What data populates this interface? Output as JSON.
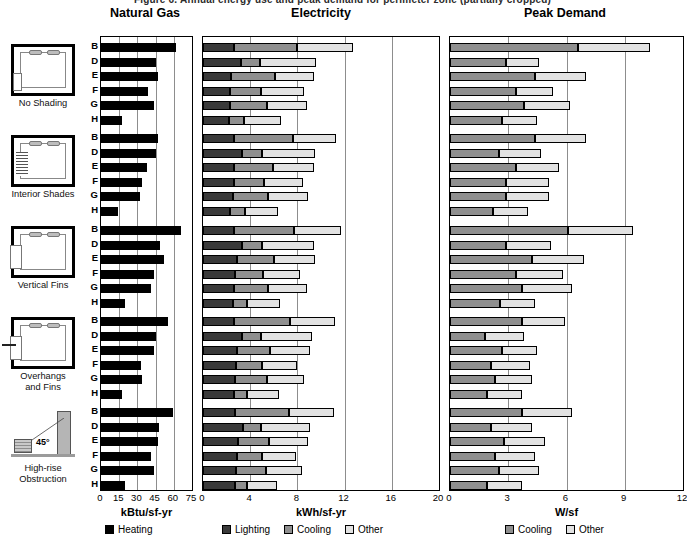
{
  "clipped_header": "Figure 6. Annual energy use and peak demand for perimeter zone (partially cropped)",
  "panels": [
    {
      "key": "natural_gas",
      "title": "Natural Gas",
      "unit": "kBtu/sf-yr",
      "ticks": [
        0,
        15,
        30,
        45,
        60,
        75
      ],
      "xmin": 0,
      "xmax": 75
    },
    {
      "key": "electricity",
      "title": "Electricity",
      "unit": "kWh/sf-yr",
      "ticks": [
        0,
        4,
        8,
        12,
        16,
        20
      ],
      "xmin": 0,
      "xmax": 20
    },
    {
      "key": "peak_demand",
      "title": "Peak Demand",
      "unit": "W/sf",
      "ticks": [
        0,
        3,
        6,
        9,
        12
      ],
      "xmin": 0,
      "xmax": 12
    }
  ],
  "legends": {
    "natural_gas": [
      {
        "label": "Heating",
        "color": "#000000"
      }
    ],
    "electricity": [
      {
        "label": "Lighting",
        "color": "#3a3a3a"
      },
      {
        "label": "Cooling",
        "color": "#8f8f8f"
      },
      {
        "label": "Other",
        "color": "#e2e2e2"
      }
    ],
    "peak_demand": [
      {
        "label": "Cooling",
        "color": "#8f8f8f"
      },
      {
        "label": "Other",
        "color": "#e2e2e2"
      }
    ]
  },
  "cases": [
    {
      "id": "no_shading",
      "label": "No Shading",
      "icon": "room-plan-no-shading-icon"
    },
    {
      "id": "interior_shades",
      "label": "Interior Shades",
      "icon": "room-plan-interior-shades-icon"
    },
    {
      "id": "vertical_fins",
      "label": "Vertical Fins",
      "icon": "room-plan-vertical-fins-icon"
    },
    {
      "id": "overhangs_and_fins",
      "label": "Overhangs\nand Fins",
      "icon": "room-plan-overhangs-fins-icon"
    },
    {
      "id": "high_rise_obstruction",
      "label": "High-rise\nObstruction",
      "icon": "high-rise-obstruction-icon"
    }
  ],
  "row_labels": [
    "B",
    "D",
    "E",
    "F",
    "G",
    "H"
  ],
  "chart_data": {
    "type": "bar",
    "orientation": "horizontal",
    "grid": true,
    "groups": [
      "No Shading",
      "Interior Shades",
      "Vertical Fins",
      "Overhangs and Fins",
      "High-rise Obstruction"
    ],
    "categories": [
      "B",
      "D",
      "E",
      "F",
      "G",
      "H"
    ],
    "subcharts": [
      {
        "name": "Natural Gas",
        "xlabel": "kBtu/sf-yr",
        "xlim": [
          0,
          75
        ],
        "xticks": [
          0,
          15,
          30,
          45,
          60,
          75
        ],
        "stacked": false,
        "series": [
          {
            "name": "Heating",
            "color": "#000000"
          }
        ],
        "values": {
          "No Shading": {
            "Heating": [
              62,
              45,
              47,
              39,
              44,
              17
            ]
          },
          "Interior Shades": {
            "Heating": [
              47,
              45,
              38,
              34,
              32,
              14
            ]
          },
          "Vertical Fins": {
            "Heating": [
              66,
              49,
              52,
              44,
              41,
              20
            ]
          },
          "Overhangs and Fins": {
            "Heating": [
              55,
              45,
              44,
              33,
              34,
              17
            ]
          },
          "High-rise Obstruction": {
            "Heating": [
              59,
              48,
              47,
              41,
              44,
              20
            ]
          }
        }
      },
      {
        "name": "Electricity",
        "xlabel": "kWh/sf-yr",
        "xlim": [
          0,
          20
        ],
        "xticks": [
          0,
          4,
          8,
          12,
          16,
          20
        ],
        "stacked": true,
        "series": [
          {
            "name": "Lighting",
            "color": "#3a3a3a"
          },
          {
            "name": "Cooling",
            "color": "#8f8f8f"
          },
          {
            "name": "Other",
            "color": "#e2e2e2"
          }
        ],
        "values": {
          "No Shading": {
            "Lighting": [
              2.6,
              3.2,
              2.4,
              2.3,
              2.3,
              2.2
            ],
            "Cooling": [
              5.4,
              1.6,
              3.7,
              2.6,
              3.1,
              1.3
            ],
            "Other": [
              4.7,
              4.8,
              3.3,
              3.7,
              3.4,
              3.1
            ]
          },
          "Interior Shades": {
            "Lighting": [
              2.6,
              3.3,
              2.6,
              2.6,
              2.5,
              2.3
            ],
            "Cooling": [
              5.0,
              1.7,
              3.3,
              2.6,
              3.0,
              1.3
            ],
            "Other": [
              3.7,
              4.5,
              3.5,
              3.3,
              3.4,
              2.8
            ]
          },
          "Vertical Fins": {
            "Lighting": [
              2.6,
              3.3,
              2.9,
              2.7,
              2.6,
              2.5
            ],
            "Cooling": [
              5.1,
              1.7,
              3.1,
              2.4,
              2.9,
              1.2
            ],
            "Other": [
              4.0,
              4.4,
              3.5,
              3.1,
              3.3,
              2.8
            ]
          },
          "Overhangs and Fins": {
            "Lighting": [
              2.6,
              3.3,
              2.9,
              2.8,
              2.7,
              2.6
            ],
            "Cooling": [
              4.8,
              1.6,
              2.8,
              2.2,
              2.7,
              1.1
            ],
            "Other": [
              3.8,
              4.3,
              3.4,
              3.0,
              3.2,
              2.7
            ]
          },
          "High-rise Obstruction": {
            "Lighting": [
              2.7,
              3.4,
              3.0,
              2.9,
              2.8,
              2.7
            ],
            "Cooling": [
              4.6,
              1.5,
              2.6,
              2.1,
              2.5,
              1.0
            ],
            "Other": [
              3.8,
              4.2,
              3.3,
              2.9,
              3.1,
              2.6
            ]
          }
        }
      },
      {
        "name": "Peak Demand",
        "xlabel": "W/sf",
        "xlim": [
          0,
          12
        ],
        "xticks": [
          0,
          3,
          6,
          9,
          12
        ],
        "stacked": true,
        "series": [
          {
            "name": "Cooling",
            "color": "#8f8f8f"
          },
          {
            "name": "Other",
            "color": "#e2e2e2"
          }
        ],
        "values": {
          "No Shading": {
            "Cooling": [
              6.6,
              2.9,
              4.4,
              3.4,
              3.8,
              2.7
            ],
            "Other": [
              3.7,
              1.7,
              2.6,
              1.9,
              2.4,
              1.8
            ]
          },
          "Interior Shades": {
            "Cooling": [
              4.4,
              2.5,
              3.4,
              2.9,
              2.9,
              2.2
            ],
            "Other": [
              2.6,
              2.2,
              2.2,
              2.2,
              2.2,
              1.8
            ]
          },
          "Vertical Fins": {
            "Cooling": [
              6.1,
              2.9,
              4.2,
              3.4,
              3.7,
              2.6
            ],
            "Other": [
              3.3,
              2.3,
              2.7,
              2.4,
              2.6,
              1.8
            ]
          },
          "Overhangs and Fins": {
            "Cooling": [
              3.7,
              1.8,
              2.7,
              2.1,
              2.3,
              1.9
            ],
            "Other": [
              2.2,
              2.0,
              1.8,
              2.0,
              1.9,
              1.8
            ]
          },
          "High-rise Obstruction": {
            "Cooling": [
              3.7,
              2.1,
              2.8,
              2.3,
              2.5,
              1.9
            ],
            "Other": [
              2.6,
              2.1,
              2.1,
              2.1,
              2.1,
              1.8
            ]
          }
        }
      }
    ]
  }
}
